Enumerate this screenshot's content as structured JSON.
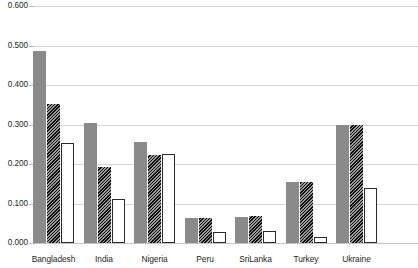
{
  "chart_data": {
    "type": "bar",
    "title": "",
    "xlabel": "",
    "ylabel": "",
    "ylim": [
      0.0,
      0.6
    ],
    "grid": true,
    "legend_position": "none",
    "categories": [
      "Bangladesh",
      "India",
      "Nigeria",
      "Peru",
      "SriLanka",
      "Turkey",
      "Ukraine"
    ],
    "ytick_labels": [
      "0.600",
      "0.500",
      "0.400",
      "0.300",
      "0.200",
      "0.100",
      "0.000"
    ],
    "ytick_values": [
      0.6,
      0.5,
      0.4,
      0.3,
      0.2,
      0.1,
      0.0
    ],
    "series": [
      {
        "name": "series-1",
        "style": "solid-gray",
        "color": "#8a8a8a",
        "values": [
          0.487,
          0.305,
          0.255,
          0.064,
          0.066,
          0.155,
          0.298
        ]
      },
      {
        "name": "series-2",
        "style": "diagonal-hatch",
        "color": "#151515",
        "values": [
          0.353,
          0.192,
          0.222,
          0.064,
          0.068,
          0.155,
          0.298
        ]
      },
      {
        "name": "series-3",
        "style": "white-outline",
        "color": "#ffffff",
        "values": [
          0.252,
          0.112,
          0.225,
          0.029,
          0.031,
          0.014,
          0.14
        ]
      }
    ]
  },
  "axis": {
    "baseline_label": "0.000",
    "top_label": "0.600"
  }
}
